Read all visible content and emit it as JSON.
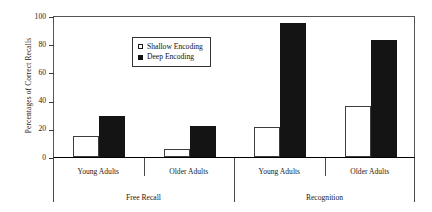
{
  "chart_data": {
    "type": "bar",
    "title": "",
    "xlabel": "",
    "ylabel": "Percentages of Correct Recalls",
    "ylim": [
      0,
      100
    ],
    "yticks": [
      0,
      20,
      40,
      60,
      80,
      100
    ],
    "grid": false,
    "legend_position": "top-left",
    "groups": [
      {
        "condition": "Free Recall",
        "subgroups": [
          {
            "label": "Young Adults",
            "shallow": 15,
            "deep": 29
          },
          {
            "label": "Older Adults",
            "shallow": 6,
            "deep": 22
          }
        ]
      },
      {
        "condition": "Recognition",
        "subgroups": [
          {
            "label": "Young Adults",
            "shallow": 21,
            "deep": 95
          },
          {
            "label": "Older Adults",
            "shallow": 36,
            "deep": 83
          }
        ]
      }
    ],
    "categories": [
      "Free Recall / Young Adults",
      "Free Recall / Older Adults",
      "Recognition / Young Adults",
      "Recognition / Older Adults"
    ],
    "series": [
      {
        "name": "Shallow Encoding",
        "values": [
          15,
          6,
          21,
          36
        ],
        "color": "#ffffff",
        "edge_color": "#3d3d3d"
      },
      {
        "name": "Deep Encoding",
        "values": [
          29,
          22,
          95,
          83
        ],
        "color": "#141414",
        "edge_color": "#141414"
      }
    ]
  },
  "legend": {
    "entries": [
      {
        "label": "Shallow Encoding",
        "marker": "open-square"
      },
      {
        "label": "Deep Encoding",
        "marker": "filled-square"
      }
    ]
  },
  "axes": {
    "y": {
      "title": "Percentages of Correct Recalls",
      "ticks": [
        "0",
        "20",
        "40",
        "60",
        "80",
        "100"
      ]
    },
    "x": {
      "subgroup_labels": [
        "Young Adults",
        "Older Adults",
        "Young Adults",
        "Older Adults"
      ],
      "condition_labels": [
        "Free Recall",
        "Recognition"
      ]
    }
  },
  "colors": {
    "shallow_fill": "#ffffff",
    "deep_fill": "#141414",
    "axis": "#000000",
    "frame": "#555555",
    "text": "#1a1a1a",
    "background": "#ffffff"
  }
}
